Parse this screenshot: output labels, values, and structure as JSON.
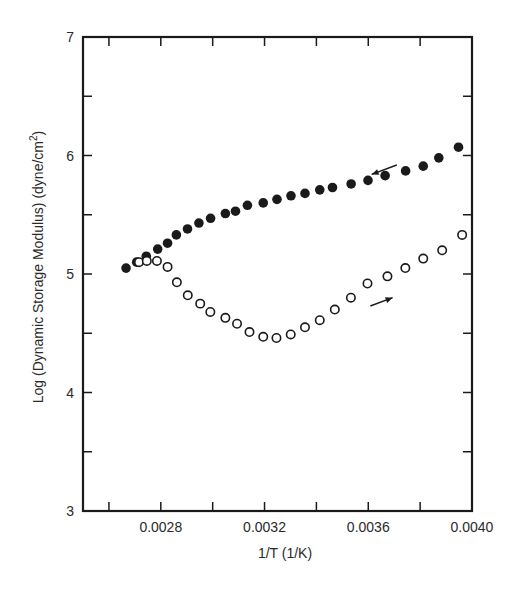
{
  "chart_data": {
    "type": "scatter",
    "title": "",
    "xlabel": "1/T (1/K)",
    "ylabel": "Log (Dynamic Storage Modulus) (dyne/cm2)",
    "ylabel_parts": {
      "main": "Log (Dynamic Storage Modulus) (dyne/cm",
      "sup": "2",
      "end": ")"
    },
    "xlim": [
      0.0025,
      0.004
    ],
    "ylim": [
      3,
      7
    ],
    "x_ticks_major": [
      0.0028,
      0.0032,
      0.0036,
      0.004
    ],
    "x_tick_labels": [
      "0.0028",
      "0.0032",
      "0.0036",
      "0.0040"
    ],
    "x_ticks_minor": [
      0.0026,
      0.003,
      0.0034,
      0.0038
    ],
    "y_ticks_major": [
      3,
      4,
      5,
      6,
      7
    ],
    "y_tick_labels": [
      "3",
      "4",
      "5",
      "6",
      "7"
    ],
    "y_ticks_minor": [
      3.5,
      4.5,
      5.5,
      6.5
    ],
    "grid": false,
    "legend": null,
    "series": [
      {
        "name": "cooling (filled circles)",
        "marker": "filled-circle",
        "direction_arrow": "left",
        "x": [
          0.002666,
          0.002707,
          0.002744,
          0.002788,
          0.002826,
          0.00286,
          0.002903,
          0.002947,
          0.002992,
          0.003049,
          0.003088,
          0.003134,
          0.003195,
          0.003248,
          0.003302,
          0.003356,
          0.003413,
          0.003462,
          0.003534,
          0.003599,
          0.003665,
          0.003744,
          0.003812,
          0.003872,
          0.003948
        ],
        "y": [
          5.05,
          5.1,
          5.15,
          5.21,
          5.26,
          5.33,
          5.38,
          5.43,
          5.47,
          5.51,
          5.53,
          5.58,
          5.6,
          5.63,
          5.66,
          5.68,
          5.71,
          5.73,
          5.76,
          5.79,
          5.83,
          5.87,
          5.91,
          5.98,
          6.07
        ]
      },
      {
        "name": "heating (open circles)",
        "marker": "open-circle",
        "direction_arrow": "right",
        "x": [
          0.002716,
          0.002746,
          0.002785,
          0.002826,
          0.002862,
          0.002904,
          0.002952,
          0.002991,
          0.003049,
          0.003094,
          0.003142,
          0.003195,
          0.003246,
          0.003301,
          0.003356,
          0.003413,
          0.003471,
          0.003533,
          0.003597,
          0.003674,
          0.003743,
          0.003812,
          0.003885,
          0.003962
        ],
        "y": [
          5.1,
          5.11,
          5.11,
          5.06,
          4.93,
          4.82,
          4.75,
          4.68,
          4.63,
          4.58,
          4.51,
          4.47,
          4.46,
          4.49,
          4.55,
          4.61,
          4.7,
          4.8,
          4.92,
          4.98,
          5.05,
          5.13,
          5.2,
          5.33
        ]
      }
    ],
    "annotations": [
      {
        "type": "arrow",
        "series": "filled",
        "from": [
          0.00371,
          5.92
        ],
        "to": [
          0.003613,
          5.84
        ],
        "meaning": "cooling direction"
      },
      {
        "type": "arrow",
        "series": "open",
        "from": [
          0.003608,
          4.73
        ],
        "to": [
          0.003694,
          4.8
        ],
        "meaning": "heating direction"
      }
    ]
  },
  "colors": {
    "ink": "#1a1a1a",
    "background": "#ffffff"
  }
}
